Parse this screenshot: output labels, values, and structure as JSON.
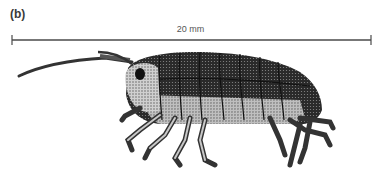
{
  "figure": {
    "panel_label": "(b)",
    "scale_bar": {
      "label": "20 mm",
      "length_mm": 20
    },
    "illustration": {
      "subject": "stippled drawing of an amphipod crustacean, lateral view, facing left",
      "colors": {
        "ink": "#1e1e1e",
        "mid": "#6b6b6b",
        "light": "#bdbdbd",
        "paper": "#ffffff"
      }
    }
  }
}
